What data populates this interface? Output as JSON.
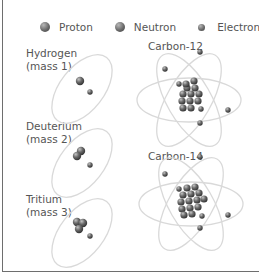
{
  "legend": {
    "items": [
      {
        "label": "Proton",
        "icon": "proton-sphere-icon",
        "size": "big"
      },
      {
        "label": "Neutron",
        "icon": "neutron-sphere-icon",
        "size": "big"
      },
      {
        "label": "Electron",
        "icon": "electron-sphere-icon",
        "size": "small"
      }
    ]
  },
  "atoms": [
    {
      "name": "Hydrogen",
      "sub": "(mass 1)",
      "protons": 1,
      "neutrons": 0,
      "electrons": 1
    },
    {
      "name": "Deuterium",
      "sub": "(mass 2)",
      "protons": 1,
      "neutrons": 1,
      "electrons": 1
    },
    {
      "name": "Tritium",
      "sub": "(mass 3)",
      "protons": 1,
      "neutrons": 2,
      "electrons": 1
    },
    {
      "name": "Carbon-12",
      "protons": 6,
      "neutrons": 6,
      "electrons": 6
    },
    {
      "name": "Carbon-14",
      "protons": 6,
      "neutrons": 8,
      "electrons": 6
    }
  ],
  "colors": {
    "orbit": "#d9d9d9",
    "particle_dark": "#3e3e3e",
    "particle_mid": "#6a6a6a",
    "particle_light": "#b8b8b8",
    "text": "#555555",
    "frame": "#6e6e6e"
  }
}
